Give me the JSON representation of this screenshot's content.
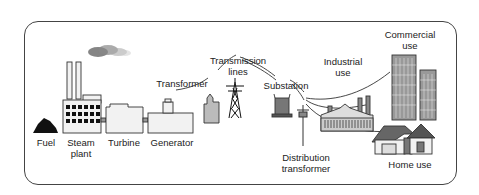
{
  "diagram": {
    "labels": {
      "fuel": "Fuel",
      "steam_plant_1": "Steam",
      "steam_plant_2": "plant",
      "turbine": "Turbine",
      "generator": "Generator",
      "transformer": "Transformer",
      "transmission_lines_1": "Transmission",
      "transmission_lines_2": "lines",
      "substation": "Substation",
      "industrial_use_1": "Industrial",
      "industrial_use_2": "use",
      "commercial_use_1": "Commercial",
      "commercial_use_2": "use",
      "distribution_transformer_1": "Distribution",
      "distribution_transformer_2": "transformer",
      "home_use": "Home use"
    },
    "flow": [
      "Fuel",
      "Steam plant",
      "Turbine",
      "Generator",
      "Transformer",
      "Transmission lines",
      "Substation",
      "Distribution transformer",
      "Industrial use",
      "Commercial use",
      "Home use"
    ],
    "colors": {
      "outline": "#444444",
      "building_fill": "#f2f2f2",
      "dark_fill": "#222222",
      "mid_gray": "#999999",
      "light_gray": "#cccccc"
    }
  }
}
